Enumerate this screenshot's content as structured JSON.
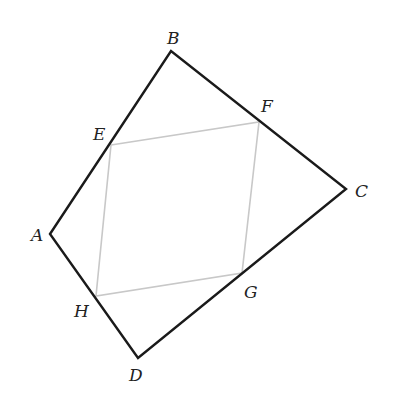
{
  "diagram": {
    "type": "quadrilateral-with-inscribed-midpoint-parallelogram",
    "colors": {
      "outer": "#1a1a1a",
      "inner": "#c8c8c8",
      "label": "#222222",
      "background": "#ffffff"
    },
    "outer_quadrilateral": {
      "vertices": [
        "A",
        "B",
        "C",
        "D"
      ]
    },
    "inner_quadrilateral": {
      "vertices": [
        "E",
        "F",
        "G",
        "H"
      ]
    },
    "points": {
      "A": {
        "label": "A",
        "x": 50,
        "y": 234,
        "label_x": 31,
        "label_y": 241
      },
      "B": {
        "label": "B",
        "x": 171,
        "y": 51,
        "label_x": 167,
        "label_y": 44
      },
      "C": {
        "label": "C",
        "x": 346,
        "y": 189,
        "label_x": 355,
        "label_y": 197
      },
      "D": {
        "label": "D",
        "x": 138,
        "y": 358,
        "label_x": 129,
        "label_y": 381
      },
      "E": {
        "label": "E",
        "x": 111,
        "y": 145,
        "label_x": 93,
        "label_y": 140
      },
      "F": {
        "label": "F",
        "x": 259,
        "y": 122,
        "label_x": 261,
        "label_y": 112
      },
      "G": {
        "label": "G",
        "x": 242,
        "y": 273,
        "label_x": 244,
        "label_y": 298
      },
      "H": {
        "label": "H",
        "x": 96,
        "y": 296,
        "label_x": 74,
        "label_y": 317
      }
    }
  }
}
